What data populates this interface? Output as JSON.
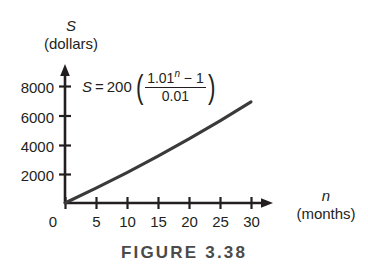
{
  "figure": {
    "caption": "FIGURE 3.38"
  },
  "equation": {
    "lhs": "S",
    "equals": "=",
    "coefficient": "200",
    "open_paren": "(",
    "close_paren": ")",
    "numerator_base": "1.01",
    "numerator_exponent": "n",
    "numerator_tail": "− 1",
    "denominator": "0.01",
    "plain": "S = 200((1.01^n − 1)/0.01)"
  },
  "chart_data": {
    "type": "line",
    "title": "",
    "subtitle": "",
    "annotation": "S = 200((1.01^n − 1)/0.01)",
    "xlabel_var": "n",
    "xlabel_unit": "(months)",
    "ylabel_var": "S",
    "ylabel_unit": "(dollars)",
    "xlim": [
      0,
      32
    ],
    "ylim": [
      0,
      8600
    ],
    "grid": false,
    "legend": false,
    "x_ticks": [
      0,
      5,
      10,
      15,
      20,
      25,
      30
    ],
    "x_tick_labels": [
      "0",
      "5",
      "10",
      "15",
      "20",
      "25",
      "30"
    ],
    "y_ticks": [
      2000,
      4000,
      6000,
      8000
    ],
    "y_tick_labels": [
      "2000",
      "4000",
      "6000",
      "8000"
    ],
    "series": [
      {
        "name": "S = 200((1.01^n - 1)/0.01)",
        "color": "#3a3a3a",
        "x": [
          0,
          5,
          10,
          15,
          20,
          25,
          30
        ],
        "values": [
          0,
          1020,
          2092,
          3217,
          4400,
          5642,
          6948
        ]
      }
    ]
  },
  "colors": {
    "curve": "#3a3a3a",
    "axis": "#231f20",
    "caption": "#4a4a4a",
    "background": "#ffffff"
  }
}
